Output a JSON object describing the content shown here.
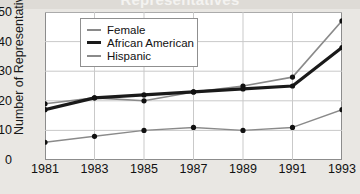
{
  "figure": {
    "title": "Representatives",
    "title_clipped": true,
    "background_color": "#e9e7e3",
    "plot_background_color": "#ffffff"
  },
  "axes": {
    "ylabel": "Number of Representatives",
    "xlabel": "",
    "yticks": [
      "0",
      "10",
      "20",
      "30",
      "40",
      "50"
    ],
    "xticks": [
      "1981",
      "1983",
      "1985",
      "1987",
      "1989",
      "1991",
      "1993"
    ]
  },
  "legend": {
    "position": "upper-left-inside",
    "items": [
      {
        "label": "Female",
        "color": "#8a8a8a",
        "width": 1.6
      },
      {
        "label": "African American",
        "color": "#1a1a1a",
        "width": 3.2
      },
      {
        "label": "Hispanic",
        "color": "#8a8a8a",
        "width": 1.4
      }
    ]
  },
  "chart_data": {
    "type": "line",
    "title": "Representatives",
    "xlabel": "",
    "ylabel": "Number of Representatives",
    "categories": [
      "1981",
      "1983",
      "1985",
      "1987",
      "1989",
      "1991",
      "1993"
    ],
    "x": [
      1981,
      1983,
      1985,
      1987,
      1989,
      1991,
      1993
    ],
    "ylim": [
      0,
      50
    ],
    "yticks": [
      0,
      10,
      20,
      30,
      40,
      50
    ],
    "grid": true,
    "markers": "filled-circle",
    "legend_position": "upper left",
    "series": [
      {
        "name": "Female",
        "color": "#8a8a8a",
        "values": [
          19,
          21,
          20,
          23,
          25,
          28,
          47
        ]
      },
      {
        "name": "African American",
        "color": "#1a1a1a",
        "values": [
          17,
          21,
          22,
          23,
          24,
          25,
          38
        ]
      },
      {
        "name": "Hispanic",
        "color": "#8a8a8a",
        "values": [
          6,
          8,
          10,
          11,
          10,
          11,
          17
        ]
      }
    ]
  }
}
